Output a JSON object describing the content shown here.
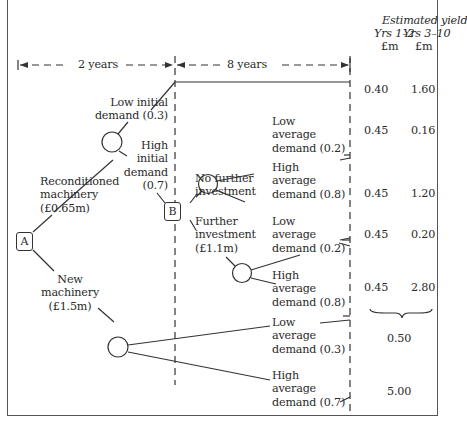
{
  "header": {
    "title": "Estimated yield",
    "col1": "Yrs 1–2",
    "col2": "Yrs 3–10",
    "unit1": "£m",
    "unit2": "£m"
  },
  "timeline": {
    "period1": "2 years",
    "period2": "8 years"
  },
  "nodes": {
    "a": "A",
    "b": "B"
  },
  "labels": {
    "low_initial": [
      "Low initial",
      "demand (0.3)"
    ],
    "high_initial": [
      "High",
      "initial",
      "demand",
      "(0.7)"
    ],
    "reconditioned": [
      "Reconditioned",
      "machinery",
      "(£0.65m)"
    ],
    "new_machinery": [
      "New",
      "machinery",
      "(£1.5m)"
    ],
    "no_further": [
      "No further",
      "investment"
    ],
    "further": [
      "Further",
      "investment",
      "(£1.1m)"
    ],
    "nf_low": [
      "Low",
      "average",
      "demand (0.2)"
    ],
    "nf_high": [
      "High",
      "average",
      "demand (0.8)"
    ],
    "f_low": [
      "Low",
      "average",
      "demand (0.2)"
    ],
    "f_high": [
      "High",
      "average",
      "demand (0.8)"
    ],
    "n_low": [
      "Low",
      "average",
      "demand (0.3)"
    ],
    "n_high": [
      "High",
      "average",
      "demand (0.7)"
    ]
  },
  "yields": [
    {
      "y12": "0.40",
      "y310": "1.60"
    },
    {
      "y12": "0.45",
      "y310": "0.16"
    },
    {
      "y12": "0.45",
      "y310": "1.20"
    },
    {
      "y12": "0.45",
      "y310": "0.20"
    },
    {
      "y12": "0.45",
      "y310": "2.80"
    }
  ],
  "new_yields": [
    "0.50",
    "5.00"
  ]
}
